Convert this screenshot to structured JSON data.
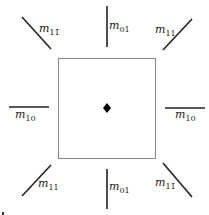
{
  "diagram": {
    "center_marker": "diamond",
    "square": {
      "x": 58,
      "y": 58,
      "w": 98,
      "h": 101,
      "stroke": "#888888"
    },
    "line_color": "#222222",
    "labels": {
      "top_left": {
        "m": "m",
        "sub": "11̄"
      },
      "top": {
        "m": "m",
        "sub": "01"
      },
      "top_right": {
        "m": "m",
        "sub": "11"
      },
      "left": {
        "m": "m",
        "sub": "10"
      },
      "right": {
        "m": "m",
        "sub": "10"
      },
      "bottom_left": {
        "m": "m",
        "sub": "11"
      },
      "bottom": {
        "m": "m",
        "sub": "01"
      },
      "bottom_right": {
        "m": "m",
        "sub": "11̄"
      }
    }
  }
}
